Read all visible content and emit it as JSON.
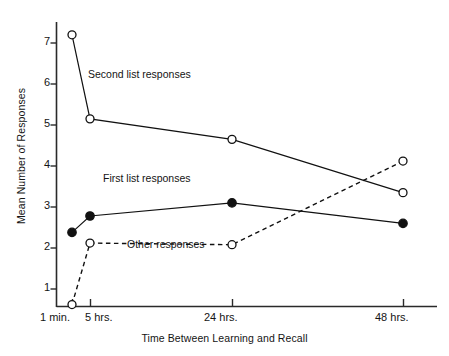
{
  "chart_data": {
    "type": "line",
    "title": "",
    "xlabel": "Time Between Learning and Recall",
    "ylabel": "Mean Number of Responses",
    "categories": [
      "1 min.",
      "5 hrs.",
      "24 hrs.",
      "48 hrs."
    ],
    "x_positions_px": [
      72,
      90,
      232,
      403
    ],
    "xtick_labels": [
      "1 min.",
      "5 hrs.",
      "24 hrs.",
      "48 hrs."
    ],
    "ytick_labels": [
      "1",
      "2",
      "3",
      "4",
      "5",
      "6",
      "7"
    ],
    "ytick_values": [
      1,
      2,
      3,
      4,
      5,
      6,
      7
    ],
    "ylim": [
      0,
      7.6
    ],
    "grid": false,
    "legend_position": "inline-annotations",
    "series": [
      {
        "name": "Second list responses",
        "values": [
          7.2,
          5.15,
          4.65,
          3.35
        ],
        "marker": "open-circle",
        "line_style": "solid",
        "color": "#111111",
        "annotation": "Second list responses"
      },
      {
        "name": "First list responses",
        "values": [
          2.38,
          2.78,
          3.1,
          2.6
        ],
        "marker": "filled-circle",
        "line_style": "solid",
        "color": "#111111",
        "annotation": "First list responses"
      },
      {
        "name": "Other responses",
        "values": [
          0.62,
          2.12,
          2.08,
          4.12
        ],
        "marker": "open-circle",
        "line_style": "dashed",
        "color": "#111111",
        "annotation": "Other responses"
      }
    ],
    "annotations": [
      {
        "text": "Second list responses",
        "x_px": 88,
        "y_px": 68
      },
      {
        "text": "First list responses",
        "x_px": 103,
        "y_px": 172
      },
      {
        "text": "Other responses",
        "x_px": 127,
        "y_px": 238
      }
    ]
  }
}
